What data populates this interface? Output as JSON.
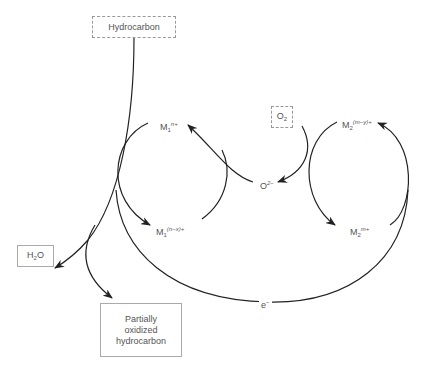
{
  "diagram": {
    "type": "redox-mechanism",
    "nodes": {
      "hydrocarbon": {
        "label": "Hydrocarbon",
        "style": "dashed"
      },
      "oxygen": {
        "base": "O",
        "sub": "2",
        "style": "dashed"
      },
      "water": {
        "base": "H",
        "sub": "2",
        "tail": "O",
        "style": "solid"
      },
      "partial": {
        "lines": [
          "Partially",
          "oxidized",
          "hydrocarbon"
        ],
        "style": "solid"
      }
    },
    "species": {
      "m1_high": {
        "base": "M",
        "sub": "1",
        "sup": "n+"
      },
      "m1_low": {
        "base": "M",
        "sub": "1",
        "sup": "(n−x)+"
      },
      "m2_low": {
        "base": "M",
        "sub": "2",
        "sup": "(m−y)+"
      },
      "m2_high": {
        "base": "M",
        "sub": "2",
        "sup": "m+"
      },
      "oxide_ion": {
        "base": "O",
        "sup": "2−"
      },
      "electron": {
        "base": "e",
        "sup": "−"
      }
    },
    "edges": [
      {
        "from": "Hydrocarbon",
        "to": "H2O"
      },
      {
        "from": "Hydrocarbon",
        "to": "Partially oxidized hydrocarbon"
      },
      {
        "from": "M1 n+",
        "to": "M1 (n−x)+"
      },
      {
        "from": "O2−",
        "to": "M1 n+"
      },
      {
        "from": "O2",
        "to": "O2−"
      },
      {
        "from": "M2 (m−y)+",
        "to": "M2 m+"
      },
      {
        "from": "e−",
        "to": "M2 (m−y)+"
      }
    ],
    "colors": {
      "line": "#222222",
      "text": "#555555",
      "border": "#999999"
    }
  }
}
